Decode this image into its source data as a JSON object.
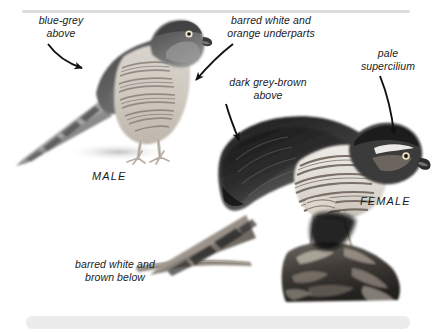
{
  "figure": {
    "style": "greyscale photographic illustration with italic annotation labels"
  },
  "annotations": [
    {
      "id": "blue-grey",
      "text": "blue-grey\nabove",
      "arrow": "curved-down-right"
    },
    {
      "id": "underparts",
      "text": "barred white and\norange underparts",
      "arrow": "curved-down-left"
    },
    {
      "id": "dark-grey",
      "text": "dark grey-brown\nabove",
      "arrow": "straight-down"
    },
    {
      "id": "supercilium",
      "text": "pale\nsupercilium",
      "arrow": "curved-down"
    },
    {
      "id": "below",
      "text": "barred white and\nbrown below",
      "arrow": "none"
    }
  ],
  "captions": {
    "male": "MALE",
    "female": "FEMALE"
  },
  "colors": {
    "background": "#ffffff",
    "rule": "#dcdcdc",
    "bottom_bar": "#ececec",
    "text": "#1b1b1b",
    "arrow": "#111111",
    "bird_dark": "#3a3a3a",
    "bird_mid": "#8f8f8f",
    "bird_light": "#d8d8d8"
  },
  "icons": {
    "arrow": "arrow-icon"
  }
}
